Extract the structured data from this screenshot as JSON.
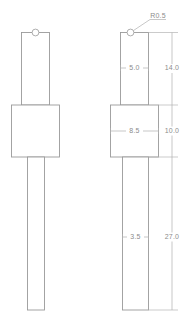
{
  "drawing": {
    "title": "Technical Part Drawing",
    "units": "mm",
    "views": [
      {
        "name": "isometric-plain-view",
        "label": "left-view",
        "has_dimensions": false,
        "features": [
          "top-rectangle",
          "center-block",
          "bottom-stem",
          "top-fillet-circle"
        ]
      },
      {
        "name": "dimensioned-view",
        "label": "right-view",
        "has_dimensions": true,
        "features": [
          "top-rectangle",
          "center-block",
          "bottom-stem",
          "top-fillet-circle"
        ]
      }
    ],
    "dimensions": [
      {
        "id": "top-width",
        "value": "5.0",
        "orientation": "horizontal",
        "location": "top-rectangle-width"
      },
      {
        "id": "top-height",
        "value": "14.0",
        "orientation": "vertical",
        "location": "top-section-height"
      },
      {
        "id": "block-width",
        "value": "8.5",
        "orientation": "horizontal",
        "location": "center-block-width"
      },
      {
        "id": "block-height",
        "value": "10.0",
        "orientation": "vertical",
        "location": "center-block-height"
      },
      {
        "id": "stem-width",
        "value": "3.5",
        "orientation": "horizontal",
        "location": "bottom-stem-width"
      },
      {
        "id": "stem-height",
        "value": "27.0",
        "orientation": "vertical",
        "location": "bottom-stem-height"
      },
      {
        "id": "fillet-radius",
        "value": "R0.5",
        "orientation": "leader",
        "location": "top-corner-fillet"
      }
    ],
    "colors": {
      "outline": "#9a9a9a",
      "dimension": "#b0b0b0",
      "text": "#8c8c8c",
      "background": "#ffffff"
    }
  }
}
